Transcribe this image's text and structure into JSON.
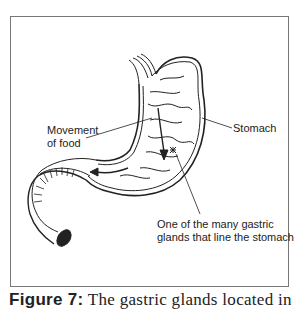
{
  "figure": {
    "labels": {
      "movement": [
        "Movement",
        "of food"
      ],
      "stomach": "Stomach",
      "glands": [
        "One of the many gastric",
        "glands that line the stomach"
      ]
    },
    "caption": {
      "prefix": "Figure 7:",
      "text": "The gastric glands located in"
    },
    "colors": {
      "line": "#222222",
      "frame": "#777777"
    }
  }
}
